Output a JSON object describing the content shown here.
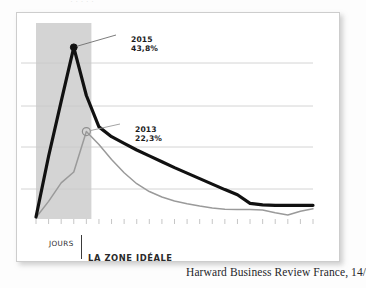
{
  "page": {
    "top_bleed_text": "·  ·   ·    ·     ·",
    "caption": "Harward Business Review France, 14/01/2016."
  },
  "axis": {
    "x_label": "JOURS",
    "zone_label": "LA ZONE IDÉALE"
  },
  "annotations": {
    "series_2015": {
      "year": "2015",
      "value": "43,8%"
    },
    "series_2013": {
      "year": "2013",
      "value": "22,3%"
    }
  },
  "colors": {
    "line_2015": "#111111",
    "line_2013": "#9a9a9a",
    "zone_band": "#d4d4d4",
    "gridline": "#c9c9c9",
    "card": "#ffffff",
    "text": "#1b1b1b"
  },
  "chart_data": {
    "type": "line",
    "title": "",
    "xlabel": "JOURS",
    "ylabel": "",
    "grid": true,
    "legend": "annotations",
    "xlim": [
      0,
      22
    ],
    "ylim": [
      0,
      50
    ],
    "gridline_values": [
      10,
      20,
      30,
      40
    ],
    "x": [
      0,
      1,
      2,
      3,
      4,
      5,
      6,
      7,
      8,
      9,
      10,
      11,
      12,
      13,
      14,
      15,
      16,
      17,
      18,
      19,
      20,
      21,
      22
    ],
    "series": [
      {
        "name": "2015",
        "color": "#111111",
        "peak_label": "43,8%",
        "peak_x": 3,
        "values": [
          0.5,
          16.0,
          30.0,
          43.8,
          31.5,
          23.5,
          21.0,
          19.3,
          17.6,
          16.1,
          14.6,
          13.1,
          11.7,
          10.3,
          8.9,
          7.5,
          6.2,
          4.0,
          3.6,
          3.5,
          3.5,
          3.5,
          3.5
        ]
      },
      {
        "name": "2013",
        "color": "#9a9a9a",
        "peak_label": "22,3%",
        "peak_x": 4,
        "values": [
          0.4,
          4.5,
          9.2,
          12.0,
          22.3,
          19.0,
          15.2,
          11.8,
          9.0,
          7.0,
          5.6,
          4.6,
          3.9,
          3.3,
          2.8,
          2.5,
          2.4,
          2.4,
          2.3,
          1.6,
          1.0,
          2.0,
          2.6
        ]
      }
    ],
    "zone": {
      "label": "LA ZONE IDÉALE",
      "x_start": 0,
      "x_end": 4.4,
      "shaded": true
    },
    "tick_count": 23
  }
}
